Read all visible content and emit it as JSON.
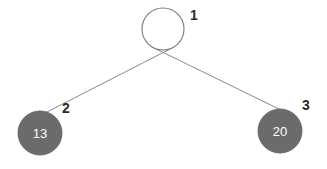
{
  "diagram": {
    "type": "binary-tree",
    "background_color": "#ffffff",
    "node_fill_color": "#6b6b6b",
    "node_empty_fill_color": "#ffffff",
    "node_stroke_color": "#7a7a7a",
    "node_value_text_color": "#ffffff",
    "node_id_text_color": "#2b2b2b",
    "edge_color": "#8a8a8a",
    "nodes": [
      {
        "id_label": "1",
        "value_label": "",
        "filled": false,
        "cx": 163,
        "cy": 29,
        "r": 21,
        "id_x": 190,
        "id_y": 20
      },
      {
        "id_label": "2",
        "value_label": "13",
        "filled": true,
        "cx": 40,
        "cy": 133,
        "r": 22,
        "id_x": 62,
        "id_y": 113
      },
      {
        "id_label": "3",
        "value_label": "20",
        "filled": true,
        "cx": 280,
        "cy": 131,
        "r": 22,
        "id_x": 302,
        "id_y": 110
      }
    ],
    "edges": [
      {
        "from": "1",
        "to": "2",
        "x1": 174,
        "y1": 47,
        "x2": 45,
        "y2": 113
      },
      {
        "from": "1",
        "to": "3",
        "x1": 152,
        "y1": 47,
        "x2": 281,
        "y2": 110
      }
    ]
  }
}
